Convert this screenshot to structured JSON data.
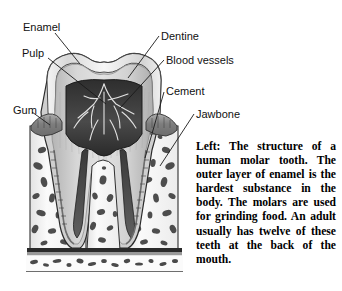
{
  "figure": {
    "labels": [
      {
        "id": "enamel",
        "text": "Enamel",
        "x": 23,
        "y": 21
      },
      {
        "id": "pulp",
        "text": "Pulp",
        "x": 22,
        "y": 47
      },
      {
        "id": "gum",
        "text": "Gum",
        "x": 13,
        "y": 104
      },
      {
        "id": "dentine",
        "text": "Dentine",
        "x": 161,
        "y": 30
      },
      {
        "id": "blood-vessels",
        "text": "Blood vessels",
        "x": 166,
        "y": 54
      },
      {
        "id": "cement",
        "text": "Cement",
        "x": 166,
        "y": 85
      },
      {
        "id": "jawbone",
        "text": "Jawbone",
        "x": 196,
        "y": 108
      }
    ],
    "caption": "Left: The structure of a human molar tooth. The outer layer of enamel is the hardest substance in the body. The molars are used for grinding food. An adult usually has twelve of these teeth at the back of the mouth.",
    "colors": {
      "background": "#ffffff",
      "label_text": "#111111",
      "caption_text": "#000000",
      "leader_line": "#1a1a1a",
      "enamel": "#e6e6e6",
      "dentine": "#c9c9c9",
      "pulp": "#3a3a3a",
      "blood_vessel": "#e8e8e8",
      "gum": "#8c8c8c",
      "bone": "#f2f2f2",
      "bone_marrow": "#5a5a5a",
      "cement": "#9a9a9a",
      "outline": "#2b2b2b"
    }
  }
}
